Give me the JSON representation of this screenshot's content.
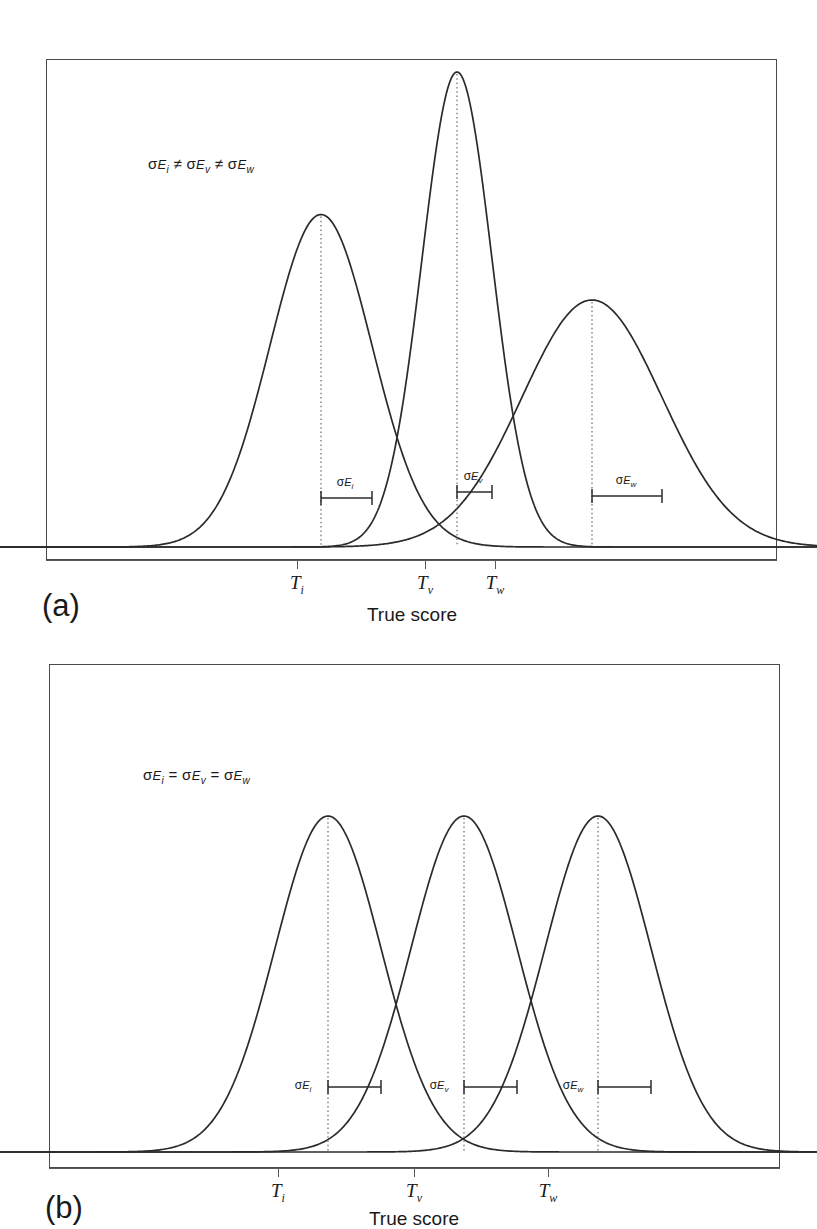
{
  "figure": {
    "axis_title": "True score",
    "line_color": "#2b2b2b",
    "frame_color": "#4a4a4a",
    "background": "#ffffff"
  },
  "panels": [
    {
      "id": "a",
      "label": "(a)",
      "annotation_html": "σ<span class=\"sigsub\">E<span class=\"tiny\">i</span></span> ≠ σ<span class=\"sigsub\">E<span class=\"tiny\">v</span></span> ≠ σ<span class=\"sigsub\">E<span class=\"tiny\">w</span></span>",
      "annotation_text": "σEi ≠ σEv ≠ σEw",
      "axis_title": "True score",
      "ticks": [
        {
          "label_html": "T<span class=\"sub\">i</span>",
          "label_text": "Ti"
        },
        {
          "label_html": "T<span class=\"sub\">v</span>",
          "label_text": "Tv"
        },
        {
          "label_html": "T<span class=\"sub\">w</span>",
          "label_text": "Tw"
        }
      ],
      "sem_labels": [
        {
          "html": "σ<span class=\"sigsub\">E<span class=\"tiny\">i</span></span>",
          "text": "σEi"
        },
        {
          "html": "σ<span class=\"sigsub\">E<span class=\"tiny\">v</span></span>",
          "text": "σEv"
        },
        {
          "html": "σ<span class=\"sigsub\">E<span class=\"tiny\">w</span></span>",
          "text": "σEw"
        }
      ]
    },
    {
      "id": "b",
      "label": "(b)",
      "annotation_html": "σ<span class=\"sigsub\">E<span class=\"tiny\">i</span></span> = σ<span class=\"sigsub\">E<span class=\"tiny\">v</span></span> = σ<span class=\"sigsub\">E<span class=\"tiny\">w</span></span>",
      "annotation_text": "σEi = σEv = σEw",
      "axis_title": "True score",
      "ticks": [
        {
          "label_html": "T<span class=\"sub\">i</span>",
          "label_text": "Ti"
        },
        {
          "label_html": "T<span class=\"sub\">v</span>",
          "label_text": "Tv"
        },
        {
          "label_html": "T<span class=\"sub\">w</span>",
          "label_text": "Tw"
        }
      ],
      "sem_labels": [
        {
          "html": "σ<span class=\"sigsub\">E<span class=\"tiny\">i</span></span>",
          "text": "σEi"
        },
        {
          "html": "σ<span class=\"sigsub\">E<span class=\"tiny\">v</span></span>",
          "text": "σEv"
        },
        {
          "html": "σ<span class=\"sigsub\">E<span class=\"tiny\">w</span></span>",
          "text": "σEw"
        }
      ]
    }
  ],
  "chart_data": [
    {
      "type": "line",
      "panel": "a",
      "title": "",
      "xlabel": "True score",
      "ylabel": "",
      "grid": false,
      "legend": "none",
      "annotation": "σEi ≠ σEv ≠ σEw",
      "description": "Three normal distributions with different standard errors of measurement; peak height is inversely related to spread.",
      "xlim": [
        0,
        731
      ],
      "ylim": [
        0,
        1
      ],
      "xticks": [
        251,
        379,
        449
      ],
      "xticklabels": [
        "Ti",
        "Tv",
        "Tw"
      ],
      "series": [
        {
          "name": "i",
          "mean_px": 274,
          "sigma_px": 51,
          "peak_height_rel": 0.7,
          "sem_bracket_px": [
            274,
            325
          ]
        },
        {
          "name": "v",
          "mean_px": 410,
          "sigma_px": 35,
          "peak_height_rel": 1.0,
          "sem_bracket_px": [
            410,
            445
          ]
        },
        {
          "name": "w",
          "mean_px": 545,
          "sigma_px": 70,
          "peak_height_rel": 0.52,
          "sem_bracket_px": [
            545,
            615
          ]
        }
      ]
    },
    {
      "type": "line",
      "panel": "b",
      "title": "",
      "xlabel": "True score",
      "ylabel": "",
      "grid": false,
      "legend": "none",
      "annotation": "σEi = σEv = σEw",
      "description": "Three normal distributions with identical standard errors of measurement; all curves have equal height and spread.",
      "xlim": [
        0,
        731
      ],
      "ylim": [
        0,
        1
      ],
      "xticks": [
        229,
        365,
        499
      ],
      "xticklabels": [
        "Ti",
        "Tv",
        "Tw"
      ],
      "series": [
        {
          "name": "i",
          "mean_px": 278,
          "sigma_px": 53,
          "peak_height_rel": 1.0,
          "sem_bracket_px": [
            278,
            331
          ]
        },
        {
          "name": "v",
          "mean_px": 414,
          "sigma_px": 53,
          "peak_height_rel": 1.0,
          "sem_bracket_px": [
            414,
            467
          ]
        },
        {
          "name": "w",
          "mean_px": 548,
          "sigma_px": 53,
          "peak_height_rel": 1.0,
          "sem_bracket_px": [
            548,
            601
          ]
        }
      ]
    }
  ]
}
